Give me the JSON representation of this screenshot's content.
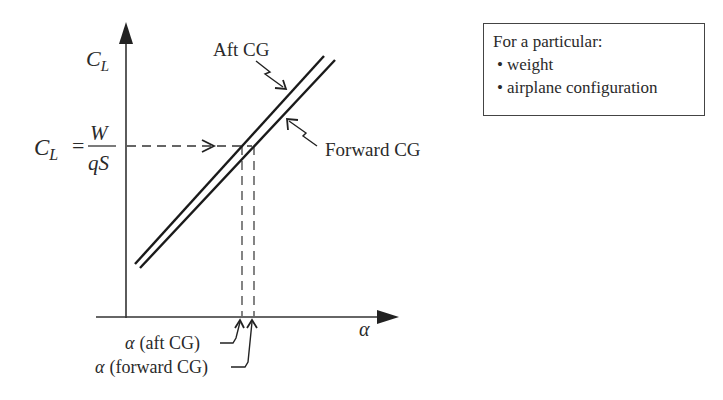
{
  "diagram": {
    "y_axis_label": "C_L",
    "y_axis_label_main": "C",
    "y_axis_label_sub": "L",
    "x_axis_label": "α",
    "equation": {
      "lhs_main": "C",
      "lhs_sub": "L",
      "equals": "=",
      "numerator": "W",
      "denominator": "qS"
    },
    "lines": [
      {
        "name": "Aft CG",
        "label": "Aft CG"
      },
      {
        "name": "Forward CG",
        "label": "Forward CG"
      }
    ],
    "alpha_labels": {
      "aft": "α (aft CG)",
      "forward": "α (forward CG)"
    },
    "legend": {
      "title": "For a particular:",
      "bullet": "•",
      "items": [
        "weight",
        "airplane configuration"
      ]
    }
  }
}
